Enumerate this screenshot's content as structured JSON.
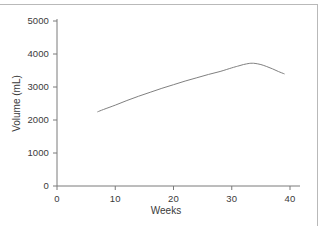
{
  "chart_data": {
    "type": "line",
    "title": "",
    "subtitle": "",
    "xlabel": "Weeks",
    "ylabel": "Volume (mL)",
    "xlim": [
      0,
      40
    ],
    "ylim": [
      0,
      5000
    ],
    "xticks": [
      0,
      10,
      20,
      30,
      40
    ],
    "yticks": [
      0,
      1000,
      2000,
      3000,
      4000,
      5000
    ],
    "xtick_labels": [
      "0",
      "10",
      "20",
      "30",
      "40"
    ],
    "ytick_labels": [
      "0",
      "1000",
      "2000",
      "3000",
      "4000",
      "5000"
    ],
    "grid": false,
    "legend": null,
    "line_color": "#808080",
    "line_width": 1,
    "annotations": [],
    "series": [
      {
        "name": "Amniotic fluid volume",
        "x": [
          7,
          8,
          10,
          12,
          14,
          16,
          18,
          20,
          22,
          24,
          26,
          28,
          30,
          31,
          32,
          33,
          33.5,
          34,
          35,
          36,
          37,
          38,
          39
        ],
        "y": [
          2250,
          2320,
          2450,
          2590,
          2720,
          2840,
          2960,
          3070,
          3180,
          3280,
          3380,
          3470,
          3580,
          3630,
          3680,
          3715,
          3720,
          3715,
          3680,
          3620,
          3550,
          3470,
          3400
        ]
      }
    ]
  },
  "figure": {
    "background_color": "#ffffff",
    "frame_color": "#b9b9b9"
  }
}
